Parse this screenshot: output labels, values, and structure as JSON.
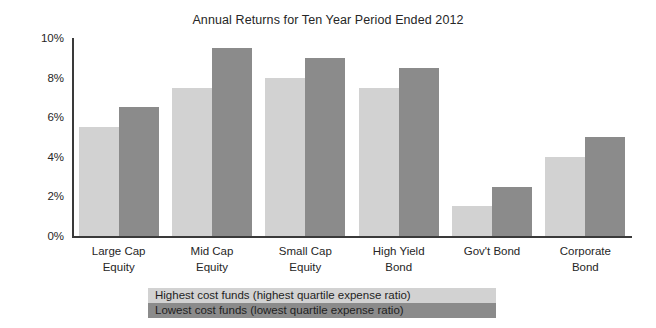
{
  "chart_data": {
    "type": "bar",
    "title": "Annual Returns for Ten Year Period Ended 2012",
    "xlabel": "",
    "ylabel": "",
    "ylim": [
      0,
      10
    ],
    "ytick_labels": [
      "0%",
      "2%",
      "4%",
      "6%",
      "8%",
      "10%"
    ],
    "ytick_values": [
      0,
      2,
      4,
      6,
      8,
      10
    ],
    "grid": false,
    "legend_position": "bottom",
    "categories": [
      "Large Cap\nEquity",
      "Mid Cap\nEquity",
      "Small Cap\nEquity",
      "High Yield\nBond",
      "Gov't Bond",
      "Corporate\nBond"
    ],
    "series": [
      {
        "name": "Highest cost funds (highest quartile expense ratio)",
        "color": "#d2d2d2",
        "values": [
          5.5,
          7.5,
          8.0,
          7.5,
          1.5,
          4.0
        ]
      },
      {
        "name": "Lowest cost funds (lowest quartile expense ratio)",
        "color": "#8b8b8b",
        "values": [
          6.5,
          9.5,
          9.0,
          8.5,
          2.5,
          5.0
        ]
      }
    ]
  }
}
